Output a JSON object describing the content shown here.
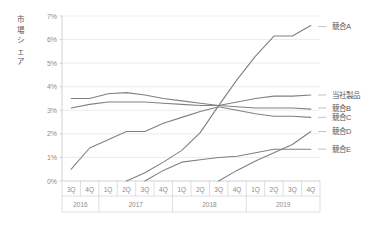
{
  "chart_data": {
    "type": "line",
    "title": "",
    "ylabel": "市場シェア",
    "xlabel": "",
    "ylim": [
      0,
      7
    ],
    "ytick_labels": [
      "0%",
      "1%",
      "2%",
      "3%",
      "4%",
      "5%",
      "6%",
      "7%"
    ],
    "ytick_values": [
      0,
      1,
      2,
      3,
      4,
      5,
      6,
      7
    ],
    "grid": true,
    "legend_position": "right-inline",
    "x": [
      "3Q 2016",
      "4Q 2016",
      "1Q 2017",
      "2Q 2017",
      "3Q 2017",
      "4Q 2017",
      "1Q 2018",
      "2Q 2018",
      "3Q 2018",
      "4Q 2018",
      "1Q 2019",
      "2Q 2019",
      "3Q 2019",
      "4Q 2019"
    ],
    "quarter_labels": [
      "3Q",
      "4Q",
      "1Q",
      "2Q",
      "3Q",
      "4Q",
      "1Q",
      "2Q",
      "3Q",
      "4Q",
      "1Q",
      "2Q",
      "3Q",
      "4Q"
    ],
    "year_groups": [
      {
        "year": "2016",
        "span": 2
      },
      {
        "year": "2017",
        "span": 4
      },
      {
        "year": "2018",
        "span": 4
      },
      {
        "year": "2019",
        "span": 4
      }
    ],
    "series": [
      {
        "name": "競合A",
        "label": "競合A",
        "color": "#808080",
        "label_y_pct": 6.55,
        "values": [
          null,
          null,
          null,
          0.0,
          0.35,
          0.8,
          1.3,
          2.05,
          3.2,
          4.3,
          5.3,
          6.15,
          6.15,
          6.6
        ]
      },
      {
        "name": "当社製品",
        "label": "当社製品",
        "color": "#808080",
        "label_y_pct": 3.65,
        "values": [
          3.1,
          3.25,
          3.35,
          3.35,
          3.35,
          3.3,
          3.25,
          3.2,
          3.2,
          3.35,
          3.5,
          3.6,
          3.6,
          3.65
        ]
      },
      {
        "name": "競合B",
        "label": "競合B",
        "color": "#808080",
        "label_y_pct": 3.1,
        "values": [
          3.5,
          3.5,
          3.7,
          3.75,
          3.65,
          3.5,
          3.4,
          3.3,
          3.2,
          3.15,
          3.1,
          3.1,
          3.1,
          3.05
        ]
      },
      {
        "name": "競合C",
        "label": "競合C",
        "color": "#808080",
        "label_y_pct": 2.7,
        "values": [
          0.5,
          1.4,
          1.75,
          2.1,
          2.1,
          2.45,
          2.7,
          2.95,
          3.15,
          3.0,
          2.85,
          2.75,
          2.75,
          2.7
        ]
      },
      {
        "name": "競合D",
        "label": "競合D",
        "color": "#808080",
        "label_y_pct": 2.1,
        "values": [
          null,
          null,
          null,
          null,
          null,
          null,
          null,
          null,
          0.0,
          0.45,
          0.85,
          1.2,
          1.55,
          2.1
        ]
      },
      {
        "name": "競合E",
        "label": "競合E",
        "color": "#808080",
        "label_y_pct": 1.35,
        "values": [
          null,
          null,
          null,
          null,
          0.0,
          0.45,
          0.8,
          0.9,
          1.0,
          1.05,
          1.2,
          1.35,
          1.35,
          1.35
        ]
      }
    ]
  }
}
